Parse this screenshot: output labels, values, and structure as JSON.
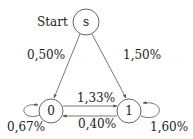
{
  "diagram": {
    "type": "state-transition",
    "start_label": "Start",
    "nodes": [
      {
        "id": "s",
        "label": "s"
      },
      {
        "id": "0",
        "label": "0"
      },
      {
        "id": "1",
        "label": "1"
      }
    ],
    "edges": [
      {
        "from": "s",
        "to": "0",
        "label": "0,50%"
      },
      {
        "from": "s",
        "to": "1",
        "label": "1,50%"
      },
      {
        "from": "0",
        "to": "1",
        "label": "1,33%"
      },
      {
        "from": "1",
        "to": "0",
        "label": "0,40%"
      },
      {
        "from": "0",
        "to": "0",
        "label": "0,67%"
      },
      {
        "from": "1",
        "to": "1",
        "label": "1,60%"
      }
    ],
    "colors": {
      "stroke": "#555555",
      "text": "#222222",
      "background": "#ffffff"
    }
  }
}
